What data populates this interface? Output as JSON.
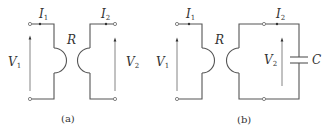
{
  "figure": {
    "panels": [
      {
        "caption": "(a)",
        "labels": {
          "current_in": {
            "main": "I",
            "sub": "1"
          },
          "current_out": {
            "main": "I",
            "sub": "2"
          },
          "voltage_in": {
            "main": "V",
            "sub": "1"
          },
          "voltage_out": {
            "main": "V",
            "sub": "2"
          },
          "resistor": "R"
        }
      },
      {
        "caption": "(b)",
        "labels": {
          "current_in": {
            "main": "I",
            "sub": "1"
          },
          "current_out": {
            "main": "I",
            "sub": "2"
          },
          "voltage_in": {
            "main": "V",
            "sub": "1"
          },
          "voltage_out": {
            "main": "V",
            "sub": "2"
          },
          "resistor": "R",
          "capacitor": "C"
        }
      }
    ],
    "colors": {
      "wire": "#555555",
      "text": "#333333",
      "background": "#ffffff"
    }
  }
}
